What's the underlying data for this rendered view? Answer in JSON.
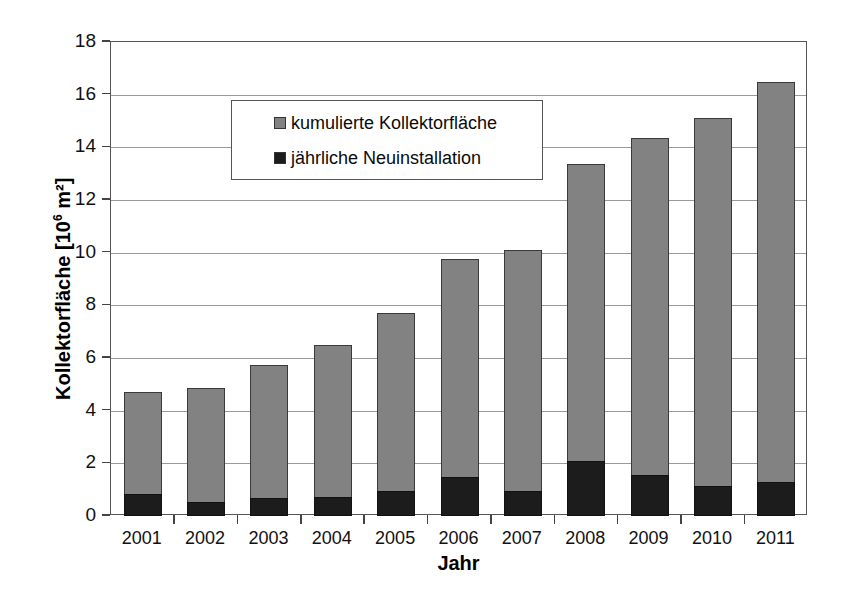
{
  "chart_data": {
    "type": "bar",
    "subtype": "stacked-overlay",
    "title": "",
    "xlabel": "Jahr",
    "ylabel": "Kollektorfläche [10⁶ m²]",
    "ylabel_base": "Kollektorfläche [10",
    "ylabel_exponent": "6",
    "ylabel_tail": " m²]",
    "categories": [
      "2001",
      "2002",
      "2003",
      "2004",
      "2005",
      "2006",
      "2007",
      "2008",
      "2009",
      "2010",
      "2011"
    ],
    "ylim": [
      0,
      18
    ],
    "ytick_step": 2,
    "yticks": [
      "0",
      "2",
      "4",
      "6",
      "8",
      "10",
      "12",
      "14",
      "16",
      "18"
    ],
    "grid": true,
    "grid_axis": "y",
    "legend_position": "upper-left-inside",
    "series": [
      {
        "name": "kumulierte Kollektorfläche",
        "color": "#828282",
        "values": [
          4.7,
          4.85,
          5.75,
          6.5,
          7.7,
          9.75,
          10.1,
          13.35,
          14.35,
          15.1,
          16.5
        ]
      },
      {
        "name": "jährliche Neuinstallation",
        "color": "#1c1c1c",
        "values": [
          0.85,
          0.55,
          0.7,
          0.72,
          0.95,
          1.5,
          0.95,
          2.1,
          1.55,
          1.15,
          1.3
        ]
      }
    ]
  },
  "legend": {
    "items": [
      {
        "label": "kumulierte Kollektorfläche",
        "swatch": "cum"
      },
      {
        "label": "jährliche Neuinstallation",
        "swatch": "new"
      }
    ]
  },
  "caption": {
    "text": ""
  }
}
